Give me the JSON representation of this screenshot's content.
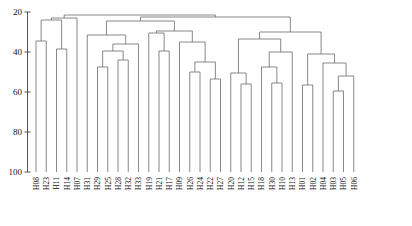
{
  "chart_data": {
    "type": "dendrogram",
    "title": "",
    "xlabel": "",
    "ylabel": "",
    "ylim": [
      20,
      100
    ],
    "y_inverted": true,
    "grid": false,
    "legend": "none",
    "yticks": [
      20,
      40,
      60,
      80,
      100
    ],
    "ytick_labels": [
      "20",
      "40",
      "60",
      "80",
      "100"
    ],
    "leaf_baseline": 100,
    "leaves": [
      "H08",
      "H23",
      "H11",
      "H14",
      "H07",
      "H31",
      "H29",
      "H25",
      "H28",
      "H32",
      "H33",
      "H19",
      "H21",
      "H17",
      "H09",
      "H26",
      "H24",
      "H22",
      "H27",
      "H20",
      "H12",
      "H15",
      "H18",
      "H30",
      "H10",
      "H13",
      "H01",
      "H02",
      "H04",
      "H03",
      "H05",
      "H06"
    ],
    "merges": [
      {
        "id": "m1",
        "left": "H08",
        "right": "H23",
        "height": 34.5
      },
      {
        "id": "m2",
        "left": "H11",
        "right": "H14",
        "height": 38.5
      },
      {
        "id": "m3",
        "left": "m1",
        "right": "m2",
        "height": 24.0
      },
      {
        "id": "m4",
        "left": "H29",
        "right": "H25",
        "height": 47.5
      },
      {
        "id": "m5",
        "left": "H28",
        "right": "H32",
        "height": 44.0
      },
      {
        "id": "m6",
        "left": "m4",
        "right": "m5",
        "height": 39.5
      },
      {
        "id": "m7",
        "left": "m6",
        "right": "H33",
        "height": 36.0
      },
      {
        "id": "m8",
        "left": "H31",
        "right": "m7",
        "height": 31.5
      },
      {
        "id": "m9",
        "left": "m3",
        "right": "H07",
        "height": 23.0
      },
      {
        "id": "m10",
        "left": "H21",
        "right": "H17",
        "height": 39.5
      },
      {
        "id": "m11",
        "left": "H19",
        "right": "m10",
        "height": 30.5
      },
      {
        "id": "m12",
        "left": "H26",
        "right": "H24",
        "height": 50.0
      },
      {
        "id": "m13",
        "left": "H22",
        "right": "H27",
        "height": 53.5
      },
      {
        "id": "m14",
        "left": "m12",
        "right": "m13",
        "height": 45.0
      },
      {
        "id": "m15",
        "left": "H09",
        "right": "m14",
        "height": 35.0
      },
      {
        "id": "m16",
        "left": "m11",
        "right": "m15",
        "height": 29.5
      },
      {
        "id": "m17",
        "left": "m8",
        "right": "m16",
        "height": 24.5
      },
      {
        "id": "m18",
        "left": "H12",
        "right": "H15",
        "height": 56.0
      },
      {
        "id": "m19",
        "left": "H20",
        "right": "m18",
        "height": 50.5
      },
      {
        "id": "m20",
        "left": "H30",
        "right": "H10",
        "height": 55.5
      },
      {
        "id": "m21",
        "left": "H18",
        "right": "m20",
        "height": 47.5
      },
      {
        "id": "m22",
        "left": "m21",
        "right": "H13",
        "height": 40.0
      },
      {
        "id": "m23",
        "left": "m19",
        "right": "m22",
        "height": 33.5
      },
      {
        "id": "m24",
        "left": "H01",
        "right": "H02",
        "height": 56.5
      },
      {
        "id": "m25",
        "left": "H03",
        "right": "H05",
        "height": 59.5
      },
      {
        "id": "m26",
        "left": "m25",
        "right": "H06",
        "height": 52.0
      },
      {
        "id": "m27",
        "left": "H04",
        "right": "m26",
        "height": 45.5
      },
      {
        "id": "m28",
        "left": "m24",
        "right": "m27",
        "height": 41.0
      },
      {
        "id": "m29",
        "left": "m23",
        "right": "m28",
        "height": 30.0
      },
      {
        "id": "m30",
        "left": "m17",
        "right": "m29",
        "height": 22.5
      },
      {
        "id": "m31",
        "left": "m9",
        "right": "m30",
        "height": 21.5
      }
    ],
    "colors": {
      "link": "#6b6b6b",
      "axis": "#555555",
      "text": "#111111",
      "background": "#ffffff"
    }
  }
}
